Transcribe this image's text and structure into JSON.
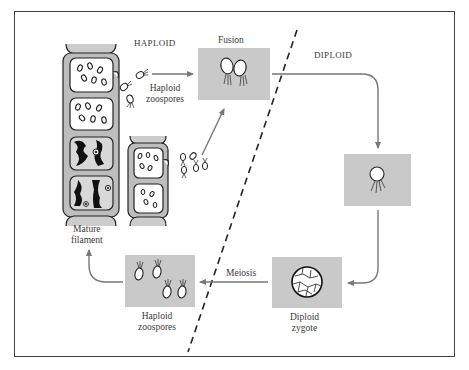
{
  "diagram": {
    "type": "life-cycle",
    "regions": {
      "haploid_label": "HAPLOID",
      "diploid_label": "DIPLOID"
    },
    "stages": [
      {
        "id": "mature-filament",
        "label_line1": "Mature",
        "label_line2": "filament"
      },
      {
        "id": "haploid-zoospores-top",
        "label_line1": "Haploid",
        "label_line2": "zoospores"
      },
      {
        "id": "fusion",
        "label": "Fusion"
      },
      {
        "id": "diploid-zoospore",
        "label": ""
      },
      {
        "id": "diploid-zygote",
        "label_line1": "Diploid",
        "label_line2": "zygote"
      },
      {
        "id": "haploid-zoospores-bottom",
        "label_line1": "Haploid",
        "label_line2": "zoospores"
      }
    ],
    "process_labels": {
      "meiosis": "Meiosis"
    },
    "colors": {
      "box_fill": "#c9c9c9",
      "arrow": "#777777",
      "frame": "#444444",
      "divider": "#222222"
    }
  }
}
